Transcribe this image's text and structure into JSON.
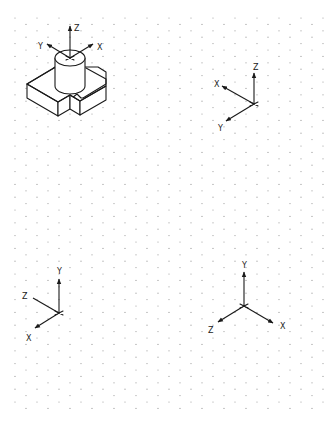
{
  "diagram": {
    "type": "isometric-grid-worksheet",
    "grid": {
      "style": "isometric dot grid",
      "dot_color": "#9a9a9a",
      "background": "#ffffff"
    },
    "part": {
      "description": "L-shaped base block with notch and cylindrical boss on top",
      "axis_triad": {
        "labels": [
          "Z",
          "Y",
          "X"
        ],
        "origin": "top face center of cylinder"
      }
    },
    "triads": [
      {
        "id": "triad-top-right",
        "labels": {
          "up": "Z",
          "left_up": "X",
          "left_down": "Y"
        }
      },
      {
        "id": "triad-bottom-left",
        "labels": {
          "up": "Y",
          "left_up": "Z",
          "left_down": "X"
        }
      },
      {
        "id": "triad-bottom-right",
        "labels": {
          "up": "Y",
          "left_down": "Z",
          "right_down": "X"
        }
      }
    ]
  },
  "labels": {
    "part_z": "Z",
    "part_y": "Y",
    "part_x": "X",
    "t1_z": "Z",
    "t1_x": "X",
    "t1_y": "Y",
    "t2_y": "Y",
    "t2_z": "Z",
    "t2_x": "X",
    "t3_y": "Y",
    "t3_z": "Z",
    "t3_x": "X"
  }
}
